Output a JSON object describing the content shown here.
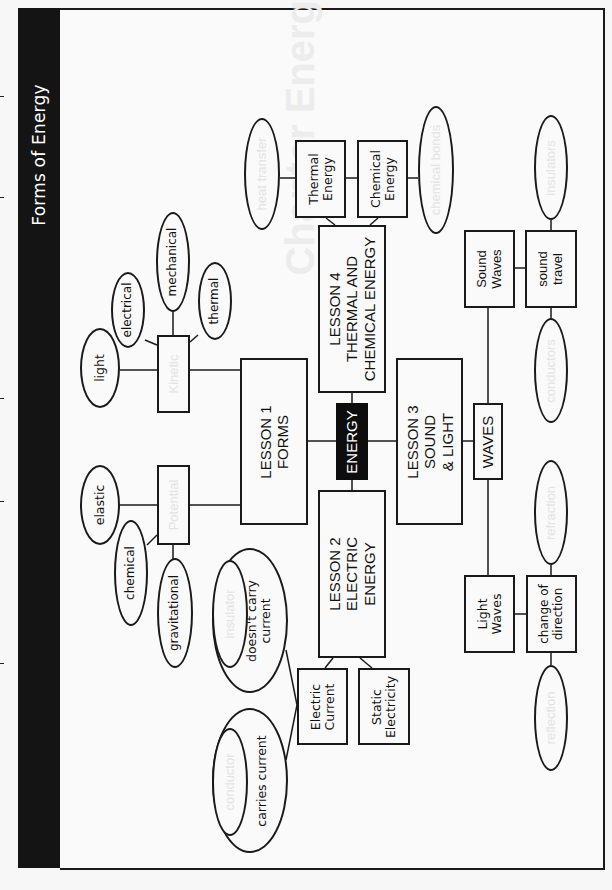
{
  "title": "Forms of Energy",
  "center": {
    "label": "ENERGY",
    "fill": "#0d0d0d"
  },
  "lessons": [
    {
      "id": "lesson1",
      "label": "LESSON 1\nFORMS"
    },
    {
      "id": "lesson2",
      "label": "LESSON 2\nELECTRIC\nENERGY"
    },
    {
      "id": "lesson3",
      "label": "LESSON 3\nSOUND\n& LIGHT"
    },
    {
      "id": "lesson4",
      "label": "LESSON 4\nTHERMAL AND\nCHEMICAL ENERGY"
    }
  ],
  "lesson1_branch": {
    "kinetic": {
      "label": "Kinetic",
      "answer_hidden": true,
      "examples": [
        "light",
        "electrical",
        "mechanical",
        "thermal"
      ]
    },
    "potential": {
      "label": "Potential",
      "answer_hidden": true,
      "examples": [
        "elastic",
        "chemical",
        "gravitational"
      ]
    }
  },
  "lesson2_branch": {
    "electric_current": "Electric\nCurrent",
    "static_electricity": "Static\nElectricity",
    "insulator": {
      "term": "insulator",
      "definition": "doesn't carry\ncurrent"
    },
    "conductor": {
      "term": "conductor",
      "definition": "carries current"
    }
  },
  "lesson3_branch": {
    "waves": "WAVES",
    "sound_waves": "Sound\nWaves",
    "sound_travel": "sound\ntravel",
    "sound_ovals": [
      "insulators",
      "conductors"
    ],
    "light_waves": "Light\nWaves",
    "change_of_direction": "change of\ndirection",
    "light_ovals": [
      "refraction",
      "reflection"
    ]
  },
  "lesson4_branch": {
    "thermal_energy": "Thermal\nEnergy",
    "chemical_energy": "Chemical\nEnergy",
    "heat_transfer": "heat transfer",
    "chemical_bonds": "chemical bonds"
  },
  "ghost_heading": "Chapter Energy Forms",
  "margin_ticks_y": [
    96,
    197,
    398,
    501,
    663
  ]
}
